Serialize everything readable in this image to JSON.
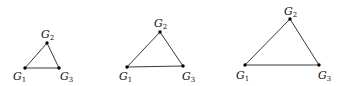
{
  "diagrams": [
    {
      "name": "small-triangle",
      "vertices": [
        {
          "label": "G",
          "sub": "1",
          "x": 25,
          "y": 68,
          "lx": 13,
          "ly": 80
        },
        {
          "label": "G",
          "sub": "2",
          "x": 47,
          "y": 43,
          "lx": 41,
          "ly": 38
        },
        {
          "label": "G",
          "sub": "3",
          "x": 59,
          "y": 68,
          "lx": 60,
          "ly": 80
        }
      ]
    },
    {
      "name": "medium-triangle",
      "vertices": [
        {
          "label": "G",
          "sub": "1",
          "x": 127,
          "y": 67,
          "lx": 119,
          "ly": 80
        },
        {
          "label": "G",
          "sub": "2",
          "x": 160,
          "y": 32,
          "lx": 154,
          "ly": 27
        },
        {
          "label": "G",
          "sub": "3",
          "x": 183,
          "y": 66,
          "lx": 182,
          "ly": 80
        }
      ]
    },
    {
      "name": "large-triangle",
      "vertices": [
        {
          "label": "G",
          "sub": "1",
          "x": 245,
          "y": 65,
          "lx": 236,
          "ly": 79
        },
        {
          "label": "G",
          "sub": "2",
          "x": 290,
          "y": 19,
          "lx": 284,
          "ly": 15
        },
        {
          "label": "G",
          "sub": "3",
          "x": 319,
          "y": 65,
          "lx": 318,
          "ly": 79
        }
      ]
    }
  ],
  "style": {
    "stroke": "#222222",
    "dot": "#000000"
  }
}
